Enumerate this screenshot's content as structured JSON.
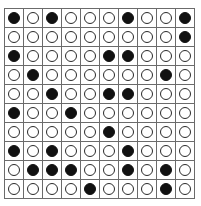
{
  "grid": {
    "rows": 10,
    "cols": 10,
    "colors": {
      "line": "#6b6b6b",
      "filled": "#111111",
      "empty_fill": "#ffffff",
      "outline": "#2a2a2a"
    },
    "cells": [
      [
        1,
        0,
        1,
        0,
        0,
        0,
        1,
        0,
        0,
        1
      ],
      [
        0,
        0,
        0,
        0,
        0,
        0,
        0,
        0,
        0,
        1
      ],
      [
        1,
        0,
        0,
        0,
        0,
        1,
        1,
        0,
        0,
        0
      ],
      [
        0,
        1,
        0,
        0,
        0,
        0,
        0,
        0,
        1,
        0
      ],
      [
        0,
        0,
        1,
        0,
        0,
        1,
        1,
        0,
        0,
        0
      ],
      [
        1,
        0,
        0,
        1,
        0,
        0,
        0,
        0,
        0,
        0
      ],
      [
        0,
        0,
        0,
        0,
        0,
        1,
        0,
        0,
        0,
        0
      ],
      [
        1,
        0,
        1,
        0,
        0,
        0,
        1,
        0,
        0,
        0
      ],
      [
        0,
        1,
        1,
        1,
        0,
        0,
        1,
        0,
        1,
        0
      ],
      [
        0,
        0,
        0,
        0,
        1,
        0,
        0,
        0,
        1,
        0
      ]
    ]
  }
}
